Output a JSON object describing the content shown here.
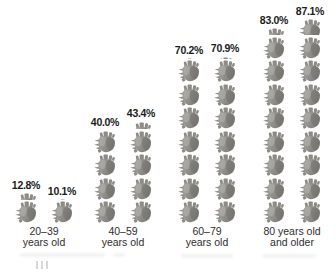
{
  "page": {
    "background": "#ffffff"
  },
  "chart_data": {
    "type": "bar",
    "subtype": "pictogram_columns",
    "title": "",
    "unit": {
      "icon_name": "anatomical-heart-icon",
      "percent_per_icon": 10
    },
    "categories": [
      "20–39 years old",
      "40–59 years old",
      "60–79 years old",
      "80 years old and older"
    ],
    "series": [
      {
        "name": "column-1",
        "values": [
          12.8,
          40.0,
          70.2,
          83.0
        ],
        "labels": [
          "12.8%",
          "40.0%",
          "70.2%",
          "83.0%"
        ]
      },
      {
        "name": "column-2",
        "values": [
          10.1,
          43.4,
          70.9,
          87.1
        ],
        "labels": [
          "10.1%",
          "43.4%",
          "70.9%",
          "87.1%"
        ]
      }
    ],
    "groups": [
      {
        "id": "20-39",
        "label_lines": [
          "20–39",
          "years old"
        ],
        "columns": [
          {
            "label": "12.8%",
            "value": 12.8
          },
          {
            "label": "10.1%",
            "value": 10.1
          }
        ]
      },
      {
        "id": "40-59",
        "label_lines": [
          "40–59",
          "years old"
        ],
        "columns": [
          {
            "label": "40.0%",
            "value": 40.0
          },
          {
            "label": "43.4%",
            "value": 43.4
          }
        ]
      },
      {
        "id": "60-79",
        "label_lines": [
          "60–79",
          "years old"
        ],
        "columns": [
          {
            "label": "70.2%",
            "value": 70.2
          },
          {
            "label": "70.9%",
            "value": 70.9
          }
        ]
      },
      {
        "id": "80-plus",
        "label_lines": [
          "80 years old",
          "and older"
        ],
        "columns": [
          {
            "label": "83.0%",
            "value": 83.0
          },
          {
            "label": "87.1%",
            "value": 87.1
          }
        ]
      }
    ],
    "ylim": [
      0,
      100
    ],
    "grid": false,
    "legend": "none",
    "colors": {
      "heart_body_light": "#a7a5a0",
      "heart_body_dark": "#7d7b76",
      "heart_vessel": "#8d8b86",
      "value_label": "#1b1b1b",
      "category_label": "#2e2e2e",
      "background": "#ffffff"
    },
    "layout": {
      "canvas_w": 336,
      "canvas_h": 274,
      "group_centers_x": [
        44,
        123,
        207,
        292
      ],
      "baseline_from_bottom": 51,
      "heart_w": 23,
      "heart_h": 22,
      "heart_gap": 1.5,
      "column_gap": 13
    }
  }
}
